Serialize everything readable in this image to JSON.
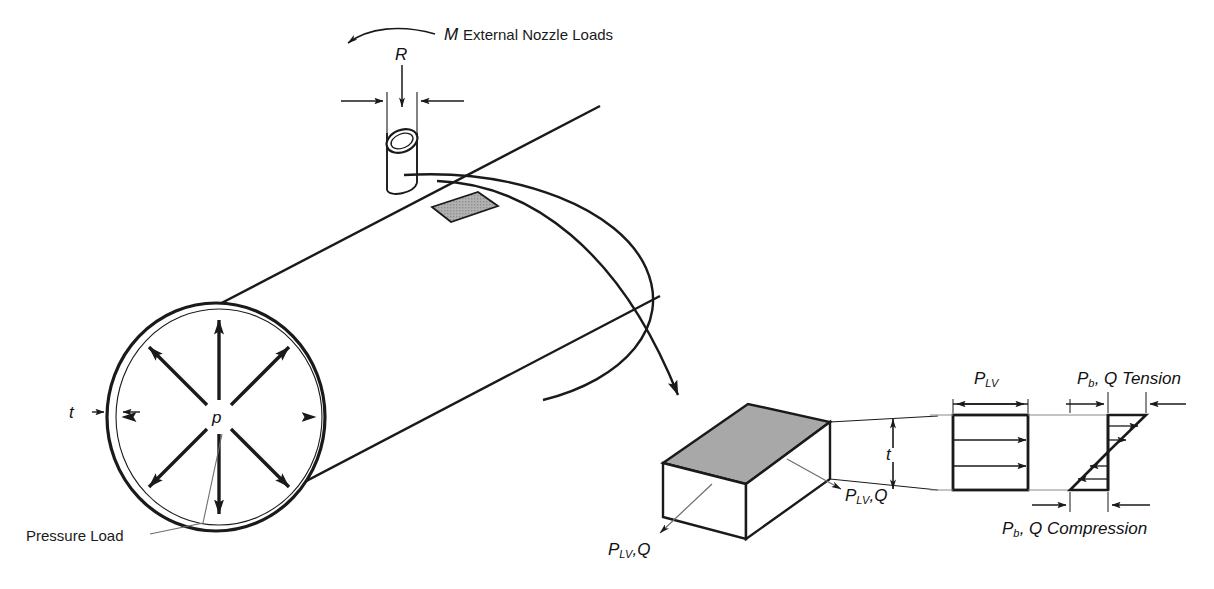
{
  "figure": {
    "background": "#ffffff",
    "line_color": "#1a1a1a",
    "shade_color": "#a8a8a8",
    "leader_color": "#5a5a5a"
  },
  "labels": {
    "moment_symbol": "M",
    "external_nozzle_loads": "External Nozzle Loads",
    "nozzle_radius": "R",
    "pressure_symbol": "p",
    "wall_thickness": "t",
    "pressure_load": "Pressure Load",
    "element_thickness": "t",
    "membrane_left": "P",
    "membrane_left_sub": "LV",
    "membrane_left_q": ",Q",
    "membrane_right": "P",
    "membrane_right_sub": "LV",
    "membrane_right_q": ",Q",
    "membrane_stress": "P",
    "membrane_stress_sub": "LV",
    "bending_tension": "P",
    "bending_tension_sub": "b",
    "bending_tension_rest": ", Q Tension",
    "bending_compression": "P",
    "bending_compression_sub": "b",
    "bending_compression_rest": ", Q Compression"
  },
  "components": {
    "vessel": "cylindrical-pressure-vessel",
    "nozzle": "nozzle-stub",
    "patch": "shaded-wall-element-patch",
    "element": "isometric-wall-element-block",
    "membrane_diagram": "uniform-membrane-stress-block",
    "bending_diagram": "linear-bending-stress-bowtie",
    "pressure_arrows": 8
  }
}
